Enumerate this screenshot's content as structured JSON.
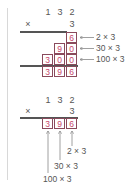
{
  "colors": {
    "text": "#555555",
    "product_digit": "#c8466a",
    "cell_border": "#8a4a5c",
    "rule": "#555555",
    "arrow": "#888888"
  },
  "expanded_method": {
    "multiplicand_digits": [
      "1",
      "3",
      "2"
    ],
    "operator": "×",
    "multiplier": "3",
    "partial_rows": [
      {
        "digits": [
          "6"
        ],
        "label": "2 × 3"
      },
      {
        "digits": [
          "9",
          "0"
        ],
        "label": "30 × 3"
      },
      {
        "digits": [
          "3",
          "0",
          "0"
        ],
        "label": "100 × 3"
      }
    ],
    "result_digits": [
      "3",
      "9",
      "6"
    ]
  },
  "compact_method": {
    "multiplicand_digits": [
      "1",
      "3",
      "2"
    ],
    "operator": "×",
    "multiplier": "3",
    "result_digits": [
      "3",
      "9",
      "6"
    ],
    "annotations": [
      "2 × 3",
      "30 × 3",
      "100 × 3"
    ]
  }
}
